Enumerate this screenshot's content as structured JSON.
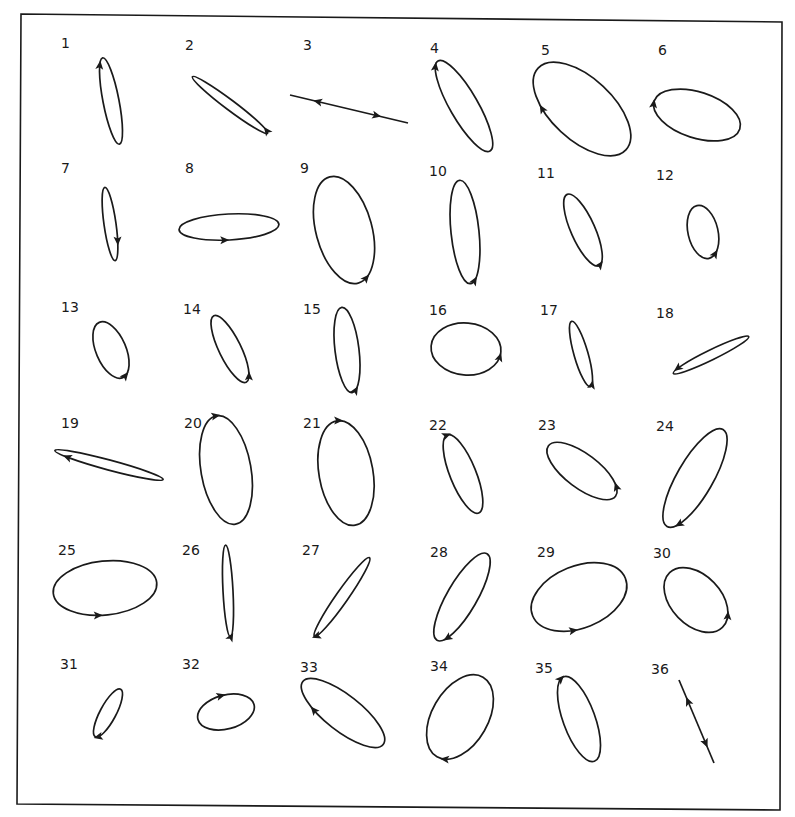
{
  "figure": {
    "panels": [
      {
        "label": "1",
        "shape": "ellipse",
        "sense": "clockwise"
      },
      {
        "label": "2",
        "shape": "ellipse",
        "sense": "counterclockwise"
      },
      {
        "label": "3",
        "shape": "line",
        "sense": "bidirectional"
      },
      {
        "label": "4",
        "shape": "ellipse",
        "sense": "clockwise"
      },
      {
        "label": "5",
        "shape": "ellipse",
        "sense": "clockwise"
      },
      {
        "label": "6",
        "shape": "ellipse",
        "sense": "clockwise"
      },
      {
        "label": "7",
        "shape": "ellipse",
        "sense": "counterclockwise"
      },
      {
        "label": "8",
        "shape": "ellipse",
        "sense": "counterclockwise"
      },
      {
        "label": "9",
        "shape": "ellipse",
        "sense": "counterclockwise"
      },
      {
        "label": "10",
        "shape": "ellipse",
        "sense": "counterclockwise"
      },
      {
        "label": "11",
        "shape": "ellipse",
        "sense": "counterclockwise"
      },
      {
        "label": "12",
        "shape": "ellipse",
        "sense": "counterclockwise"
      },
      {
        "label": "13",
        "shape": "ellipse",
        "sense": "counterclockwise"
      },
      {
        "label": "14",
        "shape": "ellipse",
        "sense": "counterclockwise"
      },
      {
        "label": "15",
        "shape": "ellipse",
        "sense": "counterclockwise"
      },
      {
        "label": "16",
        "shape": "ellipse",
        "sense": "counterclockwise"
      },
      {
        "label": "17",
        "shape": "ellipse",
        "sense": "counterclockwise"
      },
      {
        "label": "18",
        "shape": "ellipse",
        "sense": "clockwise"
      },
      {
        "label": "19",
        "shape": "ellipse",
        "sense": "clockwise"
      },
      {
        "label": "20",
        "shape": "ellipse",
        "sense": "clockwise"
      },
      {
        "label": "21",
        "shape": "ellipse",
        "sense": "clockwise"
      },
      {
        "label": "22",
        "shape": "ellipse",
        "sense": "clockwise"
      },
      {
        "label": "23",
        "shape": "ellipse",
        "sense": "counterclockwise"
      },
      {
        "label": "24",
        "shape": "ellipse",
        "sense": "counterclockwise"
      },
      {
        "label": "25",
        "shape": "ellipse",
        "sense": "counterclockwise"
      },
      {
        "label": "26",
        "shape": "ellipse",
        "sense": "counterclockwise"
      },
      {
        "label": "27",
        "shape": "ellipse",
        "sense": "counterclockwise"
      },
      {
        "label": "28",
        "shape": "ellipse",
        "sense": "counterclockwise"
      },
      {
        "label": "29",
        "shape": "ellipse",
        "sense": "counterclockwise"
      },
      {
        "label": "30",
        "shape": "ellipse",
        "sense": "counterclockwise"
      },
      {
        "label": "31",
        "shape": "ellipse",
        "sense": "counterclockwise"
      },
      {
        "label": "32",
        "shape": "ellipse",
        "sense": "clockwise"
      },
      {
        "label": "33",
        "shape": "ellipse",
        "sense": "clockwise"
      },
      {
        "label": "34",
        "shape": "ellipse",
        "sense": "clockwise"
      },
      {
        "label": "35",
        "shape": "ellipse",
        "sense": "clockwise"
      },
      {
        "label": "36",
        "shape": "line",
        "sense": "bidirectional"
      }
    ]
  }
}
